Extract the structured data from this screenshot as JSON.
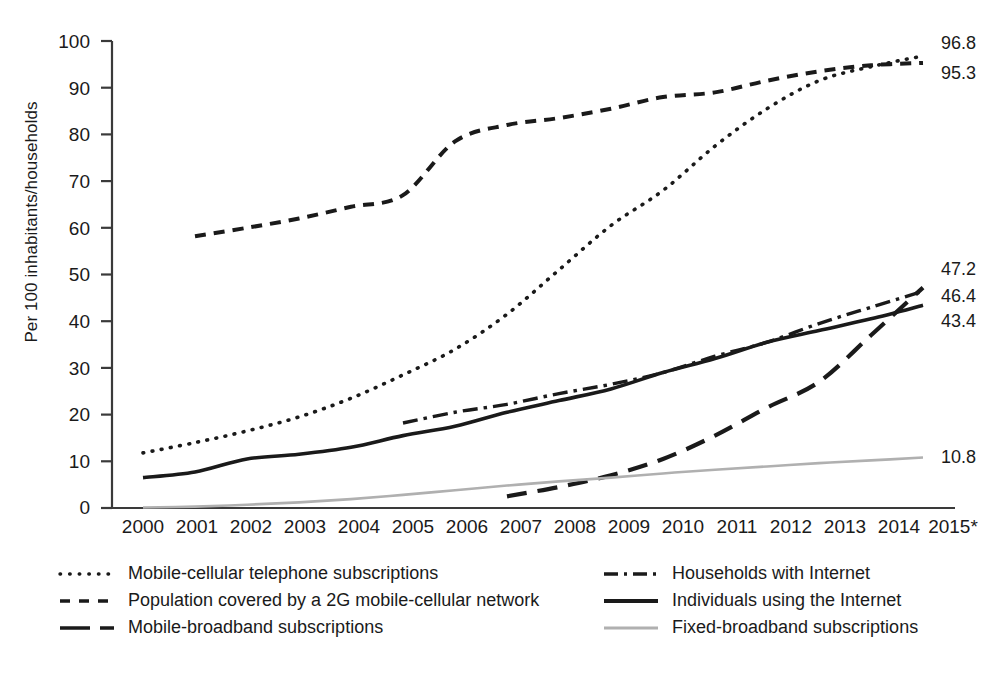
{
  "chart_data": {
    "type": "line",
    "title": "",
    "subtitle": "",
    "xlabel": "",
    "ylabel": "Per 100 inhabitants/households",
    "xlim": [
      2000,
      2015
    ],
    "ylim": [
      0,
      100
    ],
    "grid": false,
    "legend_position": "bottom",
    "x": [
      2000,
      2001,
      2002,
      2003,
      2004,
      2005,
      2006,
      2007,
      2008,
      2009,
      2010,
      2011,
      2012,
      2013,
      2014,
      2015
    ],
    "xtick_labels": [
      "2000",
      "2001",
      "2002",
      "2003",
      "2004",
      "2005",
      "2006",
      "2007",
      "2008",
      "2009",
      "2010",
      "2011",
      "2012",
      "2013",
      "2014",
      "2015*"
    ],
    "ytick_labels": [
      "0",
      "10",
      "20",
      "30",
      "40",
      "50",
      "60",
      "70",
      "80",
      "90",
      "100"
    ],
    "ytick_values": [
      0,
      10,
      20,
      30,
      40,
      50,
      60,
      70,
      80,
      90,
      100
    ],
    "series": [
      {
        "name": "Mobile-cellular telephone subscriptions",
        "style": "dotted",
        "color": "#1a1a1a",
        "end_label": "96.8",
        "x": [
          2000,
          2001,
          2002,
          2003,
          2004,
          2005,
          2006,
          2007,
          2008,
          2009,
          2010,
          2011,
          2012,
          2013,
          2014,
          2015
        ],
        "values": [
          11.8,
          14.0,
          16.5,
          19.5,
          23.5,
          28.5,
          34.0,
          41.5,
          51.0,
          60.5,
          68.0,
          77.5,
          85.5,
          91.5,
          94.5,
          96.8
        ]
      },
      {
        "name": "Population covered by a 2G mobile-cellular network",
        "style": "dashed",
        "color": "#1a1a1a",
        "end_label": "95.3",
        "x": [
          2001,
          2002,
          2003,
          2004,
          2005,
          2006,
          2007,
          2008,
          2009,
          2010,
          2011,
          2012,
          2013,
          2014,
          2015
        ],
        "values": [
          58.2,
          60.0,
          62.0,
          64.5,
          67.0,
          78.5,
          82.0,
          83.5,
          85.5,
          88.0,
          89.0,
          91.5,
          93.5,
          94.8,
          95.3
        ]
      },
      {
        "name": "Mobile-broadband subscriptions",
        "style": "long-dashed",
        "color": "#1a1a1a",
        "end_label": "47.2",
        "x": [
          2007,
          2008,
          2009,
          2010,
          2011,
          2012,
          2013,
          2014,
          2015
        ],
        "values": [
          2.5,
          4.5,
          7.0,
          10.5,
          15.5,
          21.5,
          27.0,
          37.0,
          47.2
        ]
      },
      {
        "name": "Households with Internet",
        "style": "dash-dot",
        "color": "#1a1a1a",
        "end_label": "46.4",
        "x": [
          2005,
          2006,
          2007,
          2008,
          2009,
          2010,
          2011,
          2012,
          2013,
          2014,
          2015
        ],
        "values": [
          18.2,
          20.5,
          22.2,
          24.5,
          26.5,
          29.0,
          32.5,
          35.5,
          39.5,
          43.0,
          46.4
        ]
      },
      {
        "name": "Individuals using the Internet",
        "style": "solid",
        "color": "#1a1a1a",
        "end_label": "43.4",
        "x": [
          2000,
          2001,
          2002,
          2003,
          2004,
          2005,
          2006,
          2007,
          2008,
          2009,
          2010,
          2011,
          2012,
          2013,
          2014,
          2015
        ],
        "values": [
          6.5,
          7.7,
          10.5,
          11.5,
          13.0,
          15.5,
          17.5,
          20.5,
          23.0,
          25.5,
          29.0,
          32.0,
          35.5,
          38.0,
          40.5,
          43.4
        ]
      },
      {
        "name": "Fixed-broadband subscriptions",
        "style": "solid-light",
        "color": "#b0b0b0",
        "end_label": "10.8",
        "x": [
          2000,
          2001,
          2002,
          2003,
          2004,
          2005,
          2006,
          2007,
          2008,
          2009,
          2010,
          2011,
          2012,
          2013,
          2014,
          2015
        ],
        "values": [
          0.1,
          0.3,
          0.7,
          1.2,
          1.9,
          2.8,
          3.8,
          4.8,
          5.7,
          6.5,
          7.4,
          8.2,
          8.9,
          9.6,
          10.2,
          10.8
        ]
      }
    ],
    "end_labels": [
      {
        "text": "96.8",
        "series": "Mobile-cellular telephone subscriptions"
      },
      {
        "text": "95.3",
        "series": "Population covered by a 2G mobile-cellular network"
      },
      {
        "text": "47.2",
        "series": "Mobile-broadband subscriptions"
      },
      {
        "text": "46.4",
        "series": "Households with Internet"
      },
      {
        "text": "43.4",
        "series": "Individuals using the Internet"
      },
      {
        "text": "10.8",
        "series": "Fixed-broadband subscriptions"
      }
    ],
    "legend": [
      {
        "label": "Mobile-cellular telephone subscriptions",
        "style": "dotted",
        "column": "left"
      },
      {
        "label": "Population covered by a 2G mobile-cellular network",
        "style": "dashed",
        "column": "left"
      },
      {
        "label": "Mobile-broadband subscriptions",
        "style": "long-dashed",
        "column": "left"
      },
      {
        "label": "Households with Internet",
        "style": "dash-dot",
        "column": "right"
      },
      {
        "label": "Individuals using the Internet",
        "style": "solid",
        "column": "right"
      },
      {
        "label": "Fixed-broadband subscriptions",
        "style": "solid-light",
        "column": "right"
      }
    ]
  }
}
